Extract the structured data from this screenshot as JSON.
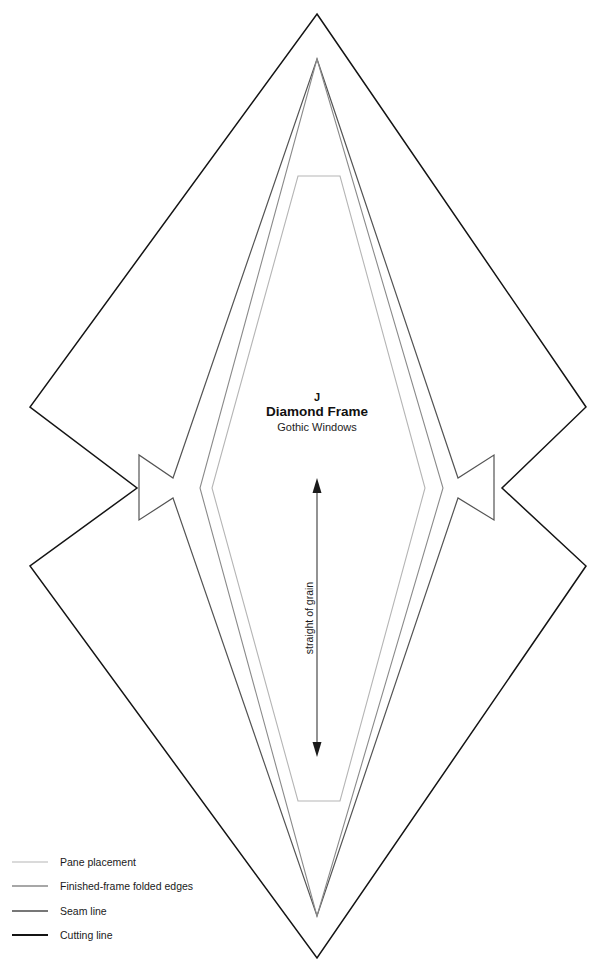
{
  "sheet": {
    "width": 615,
    "height": 977,
    "background": "#ffffff"
  },
  "piece_label": {
    "letter": "J",
    "name": "Diamond Frame",
    "collection": "Gothic Windows",
    "x": 317,
    "letter_y": 401,
    "name_y": 416,
    "collection_y": 431
  },
  "grain": {
    "label": "straight of grain",
    "x": 317,
    "y_top": 478,
    "y_bottom": 757,
    "label_x": 317,
    "label_y": 618
  },
  "lines": {
    "pane": {
      "label": "Pane placement",
      "color": "#b5b5b5",
      "width": 1.1
    },
    "folded": {
      "label": "Finished-frame folded edges",
      "color": "#8a8a8a",
      "width": 1.1
    },
    "seam": {
      "label": "Seam line",
      "color": "#545454",
      "width": 1.2
    },
    "cutting": {
      "label": "Cutting line",
      "color": "#141414",
      "width": 1.5
    }
  },
  "geometry": {
    "pane_placement": "M 298,176 L 340,176 L 425,488 L 340,801 L 298,801 L 212,488 Z",
    "folded_edges": "M 317,59 L 443,488 L 317,916 L 200,488 Z",
    "seam_line": "M 317,59 L 458,478 L 494,455 L 494,520 L 458,498 L 317,916 L 173,498 L 139,520 L 139,455 L 173,478 Z",
    "cutting_line": "M 317,14 L 586,407 L 586,566 L 317,958 L 30,566 L 30,407 Z",
    "cutting_line_notched": "M 317,14 L 586,407 L 502,488 L 586,566 L 317,958 L 30,566 L 137,488 L 30,407 Z"
  },
  "legend": {
    "x_line_start": 12,
    "x_line_end": 48,
    "x_text": 60,
    "items": [
      {
        "key": "pane",
        "label": "Pane placement",
        "y": 862,
        "color": "#b5b5b5",
        "width": 1.1
      },
      {
        "key": "folded",
        "label": "Finished-frame folded edges",
        "y": 886,
        "color": "#8a8a8a",
        "width": 1.3
      },
      {
        "key": "seam",
        "label": "Seam line",
        "y": 911,
        "color": "#4a4a4a",
        "width": 1.5
      },
      {
        "key": "cutting",
        "label": "Cutting line",
        "y": 935,
        "color": "#141414",
        "width": 2.1
      }
    ]
  }
}
